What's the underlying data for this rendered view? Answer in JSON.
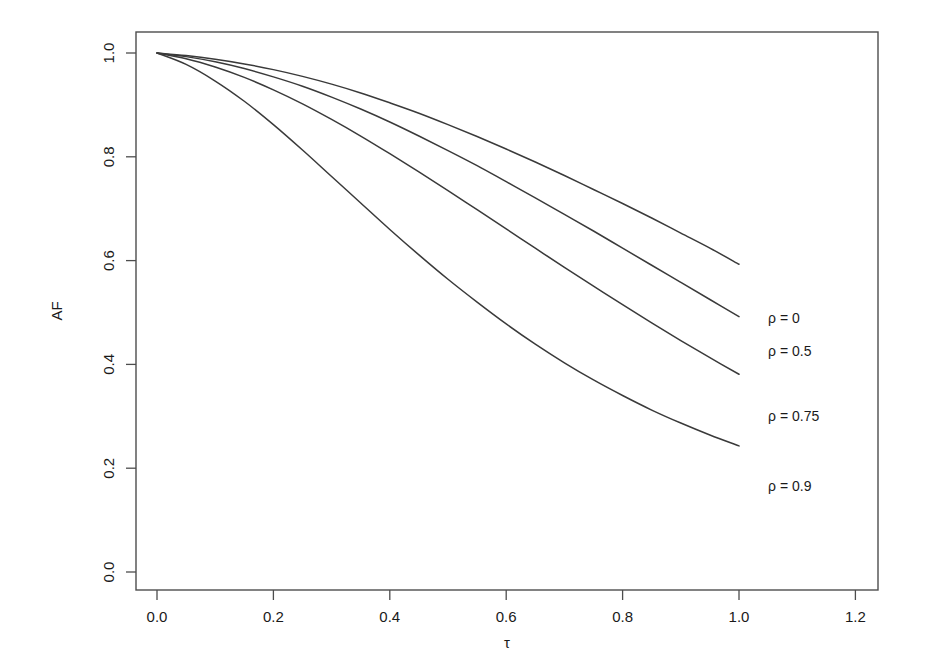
{
  "chart_data": {
    "type": "line",
    "title": "",
    "xlabel": "τ",
    "ylabel": "AF",
    "xlim": [
      -0.06,
      1.3
    ],
    "ylim": [
      -0.06,
      1.06
    ],
    "xticks": [
      "0.0",
      "0.2",
      "0.4",
      "0.6",
      "0.8",
      "1.0",
      "1.2"
    ],
    "xtick_values": [
      0.0,
      0.2,
      0.4,
      0.6,
      0.8,
      1.0,
      1.2
    ],
    "yticks": [
      "0.0",
      "0.2",
      "0.4",
      "0.6",
      "0.8",
      "1.0"
    ],
    "ytick_values": [
      0.0,
      0.2,
      0.4,
      0.6,
      0.8,
      1.0
    ],
    "grid": false,
    "legend_position": "right-inline-annotations",
    "x": [
      0.0,
      0.05,
      0.1,
      0.15,
      0.2,
      0.25,
      0.3,
      0.35,
      0.4,
      0.45,
      0.5,
      0.55,
      0.6,
      0.65,
      0.7,
      0.75,
      0.8,
      0.85,
      0.9,
      0.95,
      1.0
    ],
    "series": [
      {
        "name": "ρ = 0",
        "label": "ρ = 0",
        "label_x": 1.05,
        "label_y": 0.49,
        "values": [
          1.0,
          0.995,
          0.988,
          0.979,
          0.968,
          0.955,
          0.94,
          0.923,
          0.904,
          0.884,
          0.862,
          0.839,
          0.815,
          0.79,
          0.764,
          0.737,
          0.71,
          0.682,
          0.653,
          0.624,
          0.593
        ]
      },
      {
        "name": "ρ = 0.5",
        "label": "ρ = 0.5",
        "label_x": 1.05,
        "label_y": 0.425,
        "values": [
          1.0,
          0.993,
          0.983,
          0.97,
          0.954,
          0.936,
          0.915,
          0.892,
          0.867,
          0.84,
          0.812,
          0.783,
          0.752,
          0.721,
          0.689,
          0.657,
          0.624,
          0.591,
          0.558,
          0.525,
          0.492
        ]
      },
      {
        "name": "ρ = 0.75",
        "label": "ρ = 0.75",
        "label_x": 1.05,
        "label_y": 0.3,
        "values": [
          1.0,
          0.989,
          0.973,
          0.953,
          0.929,
          0.902,
          0.872,
          0.84,
          0.806,
          0.771,
          0.735,
          0.698,
          0.661,
          0.624,
          0.587,
          0.551,
          0.515,
          0.48,
          0.446,
          0.413,
          0.381
        ]
      },
      {
        "name": "ρ = 0.9",
        "label": "ρ = 0.9",
        "label_x": 1.05,
        "label_y": 0.165,
        "values": [
          1.0,
          0.978,
          0.946,
          0.907,
          0.862,
          0.813,
          0.762,
          0.711,
          0.66,
          0.611,
          0.564,
          0.52,
          0.478,
          0.439,
          0.403,
          0.37,
          0.34,
          0.312,
          0.287,
          0.264,
          0.243
        ]
      }
    ],
    "colors": {
      "curve": "#3a3a3a",
      "axis": "#4d4d4d",
      "text": "#1a1a1a",
      "background": "#ffffff"
    }
  }
}
